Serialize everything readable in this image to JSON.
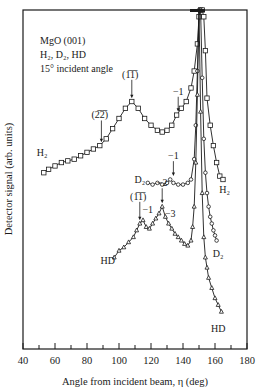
{
  "chart_data": {
    "type": "line",
    "title": "",
    "annotation_block": [
      "MgO (001)",
      "H₂, D₂, HD",
      "15° incident angle"
    ],
    "xlabel": "Angle from incident beam, η (deg)",
    "ylabel": "Detector signal (arb. units)",
    "xlim": [
      40,
      180
    ],
    "ylim": [
      0,
      100
    ],
    "x_ticks": [
      40,
      60,
      80,
      100,
      120,
      140,
      160,
      180
    ],
    "x_minor_ticks": [
      50,
      70,
      90,
      110,
      130,
      150,
      170
    ],
    "y_ticks": [],
    "grid": false,
    "legend": "inline curve labels",
    "series": [
      {
        "name": "H₂",
        "marker": "square",
        "x": [
          53,
          56,
          60,
          64,
          68,
          72,
          76,
          80,
          84,
          88,
          92,
          96,
          100,
          104,
          108,
          112,
          116,
          120,
          124,
          127,
          130,
          133,
          136,
          139,
          142,
          145,
          147,
          149,
          150,
          151,
          152,
          153,
          154,
          155,
          157,
          159,
          161,
          163,
          165
        ],
        "y": [
          52,
          53,
          54,
          55,
          55.5,
          56,
          57,
          58,
          59,
          60,
          62,
          65,
          68,
          71,
          73,
          71,
          68,
          66,
          64.5,
          64,
          64.5,
          66,
          69,
          71,
          73,
          77,
          82,
          90,
          98,
          100,
          100,
          98,
          88,
          74,
          66,
          60,
          55,
          51,
          50
        ],
        "labels": [
          {
            "text": "H₂",
            "x": 52,
            "y": 57
          },
          {
            "text": "H₂",
            "x": 166,
            "y": 46
          },
          {
            "text": "(2̅2̅)",
            "x": 88,
            "y": 68,
            "arrow_to": [
              89,
              61
            ]
          },
          {
            "text": "(1̅1̅)",
            "x": 107,
            "y": 80,
            "arrow_to": [
              108,
              74
            ]
          },
          {
            "text": "−1",
            "x": 137,
            "y": 75,
            "arrow_to": [
              137,
              70
            ]
          }
        ]
      },
      {
        "name": "D₂",
        "marker": "circle",
        "x": [
          118,
          121,
          124,
          127,
          130,
          132,
          134,
          137,
          140,
          143,
          145,
          147,
          148,
          149,
          150,
          151,
          152,
          153,
          154,
          155,
          156,
          157,
          158,
          159,
          160,
          161
        ],
        "y": [
          49,
          48.5,
          49,
          48.5,
          49,
          50,
          49,
          48.5,
          48.5,
          49,
          50,
          56,
          66,
          82,
          100,
          100,
          80,
          62,
          52,
          46,
          42,
          39,
          37,
          35,
          33.5,
          32
        ],
        "labels": [
          {
            "text": "D₂",
            "x": 113,
            "y": 49
          },
          {
            "text": "D₂",
            "x": 162,
            "y": 27
          },
          {
            "text": "−1",
            "x": 134,
            "y": 56,
            "arrow_to": [
              134,
              51
            ]
          }
        ]
      },
      {
        "name": "HD",
        "marker": "triangle",
        "x": [
          97,
          100,
          103,
          106,
          109,
          111,
          113,
          115,
          117,
          119,
          121,
          123,
          125,
          127,
          129,
          131,
          133,
          135,
          137,
          139,
          141,
          143,
          145,
          146,
          147,
          148,
          149,
          150,
          151,
          152,
          153,
          154,
          155,
          156,
          158,
          160,
          162,
          164
        ],
        "y": [
          27,
          29,
          30,
          31.5,
          33,
          35,
          37,
          38,
          36,
          35.5,
          37,
          38.5,
          40,
          42,
          39,
          37,
          35.5,
          34,
          33,
          32,
          31,
          30.5,
          32,
          36,
          42,
          55,
          75,
          100,
          70,
          46,
          33,
          27,
          24,
          21,
          18,
          15,
          13,
          11
        ],
        "labels": [
          {
            "text": "HD",
            "x": 93,
            "y": 25
          },
          {
            "text": "HD",
            "x": 162,
            "y": 5
          },
          {
            "text": "(1̅1̅)",
            "x": 112,
            "y": 44,
            "arrow_to": [
              113,
              38
            ]
          },
          {
            "text": "−1",
            "x": 118,
            "y": 40
          },
          {
            "text": "−2",
            "x": 127,
            "y": 48,
            "arrow_to": [
              127,
              43
            ]
          },
          {
            "text": "−3",
            "x": 132,
            "y": 39
          }
        ]
      }
    ]
  }
}
